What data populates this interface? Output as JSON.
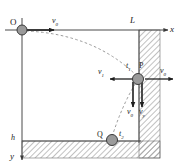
{
  "figure": {
    "type": "physics-projectile-diagram",
    "width": 181,
    "height": 168
  },
  "axes": {
    "x_label": "x",
    "y_label": "y",
    "origin_label": "O",
    "wall_distance_label": "L",
    "depth_label": "h"
  },
  "points": {
    "origin": {
      "label": "O",
      "cx": 22,
      "cy": 30,
      "r": 5
    },
    "impact": {
      "label": "P",
      "cx": 139,
      "cy": 79,
      "r": 5.5
    },
    "landing": {
      "label": "Q",
      "cx": 111,
      "cy": 141,
      "r": 5.5
    }
  },
  "times": {
    "t1_label": "t",
    "t1_sub": "1",
    "t2_label": "t",
    "t2_sub": "2"
  },
  "velocities": {
    "initial": {
      "label": "v",
      "sub": "0"
    },
    "rebound": {
      "label": "v",
      "sub": "1"
    },
    "wall_out": {
      "label": "v",
      "sub": "0"
    },
    "vert_left": {
      "label": "v",
      "sub": "0"
    },
    "vert_right": {
      "label": "v",
      "sub": "y"
    }
  },
  "colors": {
    "line": "#2b2b2b",
    "ball_fill": "#9a9a9a",
    "ball_stroke": "#3a3a3a",
    "hatch": "#8d8d8d",
    "dashed": "#8a8a8a",
    "axis": "#555555",
    "background": "#ffffff"
  },
  "geometry": {
    "axis_y": 30,
    "wall_x": 139,
    "ground_y": 141,
    "wall_right": 160,
    "ground_bottom": 158
  }
}
